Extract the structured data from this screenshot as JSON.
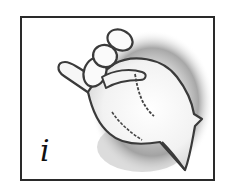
{
  "card": {
    "letter": "i",
    "illustration": "hand-sign-letter-i-icon",
    "description": "Hand with pinky finger extended, other fingers curled (sign language letter I)"
  },
  "colors": {
    "border": "#2a2a2a",
    "outline": "#3a3a3a",
    "shadow": "#9a9a9a",
    "background": "#ffffff",
    "letter": "#111111"
  }
}
